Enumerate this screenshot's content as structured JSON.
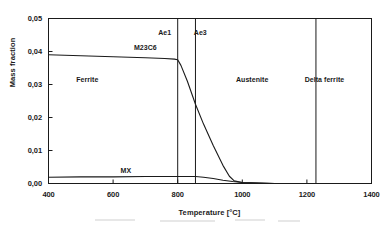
{
  "chart_data": {
    "type": "line",
    "title": "",
    "xlabel": "Temperature [°C]",
    "ylabel": "Mass fraction",
    "xlim": [
      400,
      1400
    ],
    "ylim": [
      0.0,
      0.05
    ],
    "xticks": [
      400,
      600,
      800,
      1000,
      1200,
      1400
    ],
    "xtick_labels": [
      "400",
      "600",
      "800",
      "1000",
      "1200",
      "1400"
    ],
    "yticks": [
      0.0,
      0.01,
      0.02,
      0.03,
      0.04,
      0.05
    ],
    "ytick_labels": [
      "0,00",
      "0,01",
      "0,02",
      "0,03",
      "0,04",
      "0,05"
    ],
    "grid": false,
    "legend": "none",
    "series": [
      {
        "name": "M23C6",
        "label": "M23C6",
        "color": "#1a1a1a",
        "x": [
          400,
          500,
          600,
          700,
          760,
          790,
          800,
          810,
          830,
          855,
          880,
          910,
          940,
          960,
          975,
          1000,
          1100,
          1400
        ],
        "values": [
          0.039,
          0.0387,
          0.0384,
          0.0381,
          0.0379,
          0.0377,
          0.0375,
          0.0358,
          0.031,
          0.024,
          0.018,
          0.0115,
          0.0055,
          0.0022,
          0.0008,
          0.0003,
          0.0,
          0.0
        ]
      },
      {
        "name": "MX",
        "label": "MX",
        "color": "#1a1a1a",
        "x": [
          400,
          500,
          600,
          700,
          800,
          855,
          880,
          910,
          940,
          970,
          1000,
          1050,
          1100,
          1400
        ],
        "values": [
          0.0019,
          0.002,
          0.002,
          0.0021,
          0.0021,
          0.0021,
          0.0019,
          0.0015,
          0.001,
          0.0006,
          0.0003,
          0.0001,
          0.0,
          0.0
        ]
      }
    ],
    "vertical_lines": [
      {
        "name": "Ae1",
        "label": "Ae1",
        "x": 800,
        "label_side": "left"
      },
      {
        "name": "Ae3",
        "label": "Ae3",
        "x": 855,
        "label_side": "right"
      },
      {
        "name": "delta-ferrite-boundary",
        "label": "",
        "x": 1228,
        "label_side": "none"
      }
    ],
    "region_labels": [
      {
        "name": "ferrite",
        "label": "Ferrite",
        "x": 520,
        "y": 0.0315
      },
      {
        "name": "austenite",
        "label": "Austenite",
        "x": 1030,
        "y": 0.0315
      },
      {
        "name": "delta-ferrite",
        "label": "Delta ferrite",
        "x": 1255,
        "y": 0.0315
      }
    ],
    "series_label_positions": [
      {
        "name": "M23C6",
        "label": "M23C6",
        "x": 700,
        "y": 0.041
      },
      {
        "name": "MX",
        "label": "MX",
        "x": 640,
        "y": 0.0038
      }
    ],
    "vline_label_positions": [
      {
        "name": "Ae1",
        "label": "Ae1",
        "x": 760,
        "y": 0.0455
      },
      {
        "name": "Ae3",
        "label": "Ae3",
        "x": 870,
        "y": 0.0455
      }
    ],
    "colors": {
      "axis": "#1a1a1a",
      "curve": "#1a1a1a",
      "background": "#ffffff"
    }
  }
}
